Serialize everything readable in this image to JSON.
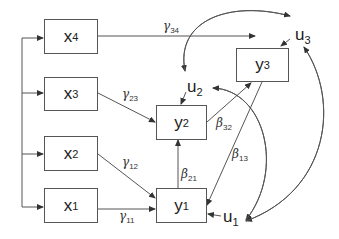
{
  "diagram": {
    "type": "path-diagram",
    "exogenous": [
      {
        "id": "x4",
        "base": "x",
        "sub": "4"
      },
      {
        "id": "x3",
        "base": "x",
        "sub": "3"
      },
      {
        "id": "x2",
        "base": "x",
        "sub": "2"
      },
      {
        "id": "x1",
        "base": "x",
        "sub": "1"
      }
    ],
    "endogenous": [
      {
        "id": "y1",
        "base": "y",
        "sub": "1"
      },
      {
        "id": "y2",
        "base": "y",
        "sub": "2"
      },
      {
        "id": "y3",
        "base": "y",
        "sub": "3"
      }
    ],
    "disturbances": [
      {
        "id": "u1",
        "base": "u",
        "sub": "1"
      },
      {
        "id": "u2",
        "base": "u",
        "sub": "2"
      },
      {
        "id": "u3",
        "base": "u",
        "sub": "3"
      }
    ],
    "coefficients": [
      {
        "id": "g34",
        "sym": "γ",
        "sub": "34",
        "from": "x4",
        "to": "y3"
      },
      {
        "id": "g23",
        "sym": "γ",
        "sub": "23",
        "from": "x3",
        "to": "y2"
      },
      {
        "id": "g12",
        "sym": "γ",
        "sub": "12",
        "from": "x2",
        "to": "y1"
      },
      {
        "id": "g11",
        "sym": "γ",
        "sub": "11",
        "from": "x1",
        "to": "y1"
      },
      {
        "id": "b21",
        "sym": "β",
        "sub": "21",
        "from": "y1",
        "to": "y2"
      },
      {
        "id": "b32",
        "sym": "β",
        "sub": "32",
        "from": "y2",
        "to": "y3"
      },
      {
        "id": "b13",
        "sym": "β",
        "sub": "13",
        "from": "y3",
        "to": "y1"
      }
    ],
    "covariances": [
      {
        "between": [
          "u2",
          "u3"
        ]
      },
      {
        "between": [
          "u1",
          "u2"
        ]
      },
      {
        "between": [
          "u1",
          "u3"
        ]
      }
    ],
    "line_color": "#555555"
  }
}
